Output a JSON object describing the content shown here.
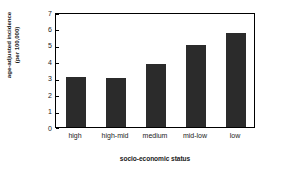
{
  "chart_data": {
    "type": "bar",
    "title": "",
    "subtitle": "",
    "categories": [
      "high",
      "high-mid",
      "medium",
      "mid-low",
      "low"
    ],
    "values": [
      3.05,
      3.0,
      3.85,
      5.0,
      5.75
    ],
    "xlabel": "socio-economic status",
    "ylabel": "age-adjusted incidence (per 100,000)",
    "ylabel_line1": "age-adjusted incidence",
    "ylabel_line2": "(per 100,000)",
    "ylim": [
      0,
      7
    ],
    "yticks": [
      0,
      1,
      2,
      3,
      4,
      5,
      6,
      7
    ],
    "ytick_labels": [
      "0",
      "1",
      "2",
      "3",
      "4",
      "5",
      "6",
      "7"
    ],
    "grid": false,
    "legend": false,
    "legend_position": "none",
    "bar_color": "#2b2b2b",
    "axis_color": "#000000",
    "background_color": "#ffffff"
  }
}
